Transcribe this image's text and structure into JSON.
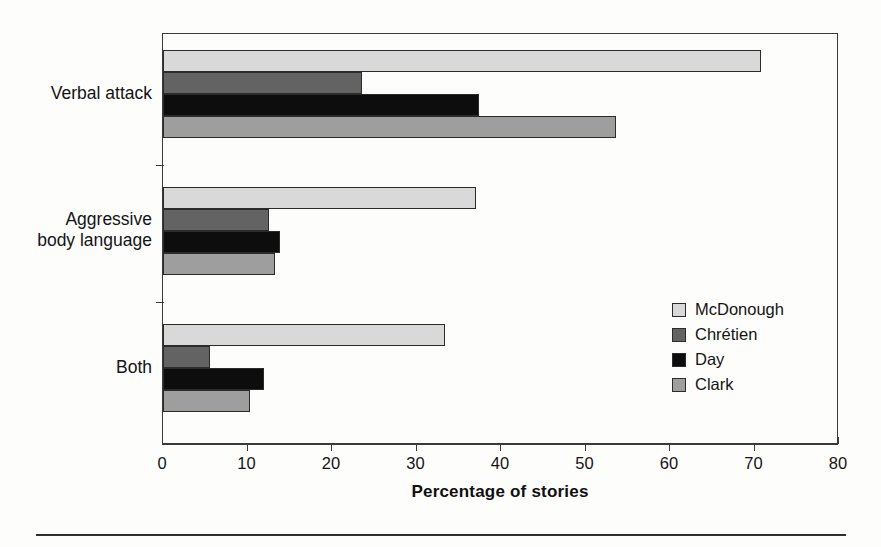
{
  "chart_data": {
    "type": "bar",
    "orientation": "horizontal",
    "title": "",
    "xlabel": "Percentage of stories",
    "ylabel": "",
    "xlim": [
      0,
      80
    ],
    "xticks": [
      "0",
      "10",
      "20",
      "30",
      "40",
      "50",
      "60",
      "70",
      "80"
    ],
    "grid": false,
    "legend_position": "inside-right",
    "categories": [
      "Verbal attack",
      "Aggressive\nbody language",
      "Both"
    ],
    "series": [
      {
        "name": "McDonough",
        "color": "#d9d9d9",
        "values": [
          70.8,
          37.0,
          33.4
        ]
      },
      {
        "name": "Chrétien",
        "color": "#636363",
        "values": [
          23.5,
          12.6,
          5.6
        ]
      },
      {
        "name": "Day",
        "color": "#0d0d0d",
        "values": [
          37.4,
          13.8,
          11.9
        ]
      },
      {
        "name": "Clark",
        "color": "#9e9e9e",
        "values": [
          53.6,
          13.3,
          10.3
        ]
      }
    ]
  },
  "axis": {
    "title": "Percentage of stories"
  },
  "legend": {
    "items": [
      {
        "label": "McDonough",
        "color": "#d9d9d9"
      },
      {
        "label": "Chrétien",
        "color": "#636363"
      },
      {
        "label": "Day",
        "color": "#0d0d0d"
      },
      {
        "label": "Clark",
        "color": "#9e9e9e"
      }
    ]
  }
}
